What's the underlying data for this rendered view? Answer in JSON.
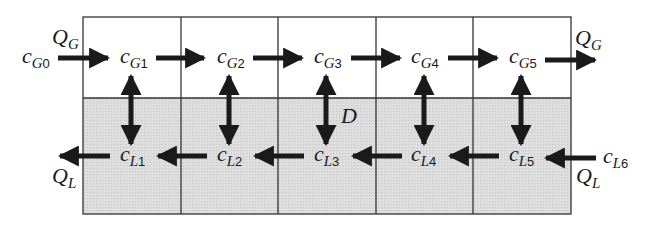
{
  "diagram": {
    "type": "countercurrent-stage-cascade",
    "colors": {
      "gas_region": "#ffffff",
      "liquid_region": "#d9d9d9",
      "grid_line": "#333333",
      "arrow": "#1a1a1a"
    },
    "stages": 5,
    "gas_phase": {
      "flow_label": "Q",
      "flow_sub": "G",
      "inlet": {
        "main": "c",
        "sub_phase": "G",
        "sub_index": "0"
      },
      "nodes": [
        {
          "main": "c",
          "sub_phase": "G",
          "sub_index": "1"
        },
        {
          "main": "c",
          "sub_phase": "G",
          "sub_index": "2"
        },
        {
          "main": "c",
          "sub_phase": "G",
          "sub_index": "3"
        },
        {
          "main": "c",
          "sub_phase": "G",
          "sub_index": "4"
        },
        {
          "main": "c",
          "sub_phase": "G",
          "sub_index": "5"
        }
      ],
      "direction": "left-to-right"
    },
    "liquid_phase": {
      "flow_label": "Q",
      "flow_sub": "L",
      "inlet": {
        "main": "c",
        "sub_phase": "L",
        "sub_index": "6"
      },
      "nodes": [
        {
          "main": "c",
          "sub_phase": "L",
          "sub_index": "1"
        },
        {
          "main": "c",
          "sub_phase": "L",
          "sub_index": "2"
        },
        {
          "main": "c",
          "sub_phase": "L",
          "sub_index": "3"
        },
        {
          "main": "c",
          "sub_phase": "L",
          "sub_index": "4"
        },
        {
          "main": "c",
          "sub_phase": "L",
          "sub_index": "5"
        }
      ],
      "direction": "right-to-left"
    },
    "exchange_label": "D"
  }
}
